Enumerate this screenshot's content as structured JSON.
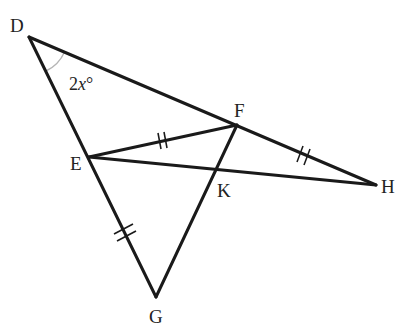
{
  "diagram": {
    "type": "geometry-figure",
    "points": {
      "D": {
        "label": "D",
        "x": 29,
        "y": 37
      },
      "E": {
        "label": "E",
        "x": 89,
        "y": 157
      },
      "F": {
        "label": "F",
        "x": 237,
        "y": 125
      },
      "G": {
        "label": "G",
        "x": 156,
        "y": 297
      },
      "H": {
        "label": "H",
        "x": 376,
        "y": 185
      },
      "K": {
        "label": "K",
        "x": 217,
        "y": 175
      }
    },
    "segments": [
      "DH",
      "DG",
      "EF",
      "EH",
      "FG"
    ],
    "congruence_marks": [
      {
        "segment": "EF",
        "ticks": 2
      },
      {
        "segment": "FH",
        "ticks": 2
      },
      {
        "segment": "EG",
        "ticks": 2
      }
    ],
    "angle": {
      "vertex": "D",
      "between": [
        "DF",
        "DE"
      ],
      "label_number": "2",
      "label_variable": "x",
      "label_unit": "°"
    },
    "colors": {
      "line": "#1a1a1a",
      "angle_arc": "#b5b5b5",
      "background": "#ffffff"
    }
  }
}
